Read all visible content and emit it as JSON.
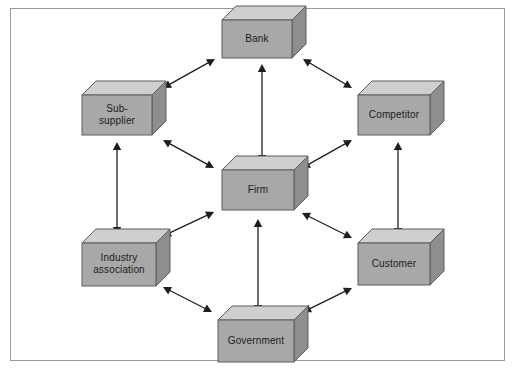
{
  "figure": {
    "kind": "network-diagram",
    "title": "",
    "frame": {
      "border_color": "#9a9a9a",
      "background": "#ffffff"
    },
    "box_colors": {
      "front": "#a8a8a8",
      "top": "#cfcfcf",
      "side": "#8e8e8e",
      "outline": "#5d5d5d"
    },
    "arrow_color": "#1e1e1e"
  },
  "nodes": [
    {
      "id": "bank",
      "label": "Bank",
      "lines": [
        "Bank"
      ],
      "x": 222,
      "y": 20,
      "w": 70,
      "h": 38,
      "depth": 14
    },
    {
      "id": "subsupplier",
      "label": "Sub-supplier",
      "lines": [
        "Sub-",
        "supplier"
      ],
      "x": 82,
      "y": 95,
      "w": 70,
      "h": 40,
      "depth": 14
    },
    {
      "id": "competitor",
      "label": "Competitor",
      "lines": [
        "Competitor"
      ],
      "x": 358,
      "y": 95,
      "w": 72,
      "h": 40,
      "depth": 14
    },
    {
      "id": "firm",
      "label": "Firm",
      "lines": [
        "Firm"
      ],
      "x": 222,
      "y": 170,
      "w": 72,
      "h": 40,
      "depth": 14
    },
    {
      "id": "industry",
      "label": "Industry association",
      "lines": [
        "Industry",
        "association"
      ],
      "x": 82,
      "y": 243,
      "w": 74,
      "h": 43,
      "depth": 14
    },
    {
      "id": "customer",
      "label": "Customer",
      "lines": [
        "Customer"
      ],
      "x": 358,
      "y": 243,
      "w": 72,
      "h": 42,
      "depth": 14
    },
    {
      "id": "government",
      "label": "Government",
      "lines": [
        "Government"
      ],
      "x": 218,
      "y": 320,
      "w": 76,
      "h": 42,
      "depth": 14
    }
  ],
  "connections": [
    {
      "from": "subsupplier",
      "to": "bank",
      "style": "double-arrow"
    },
    {
      "from": "bank",
      "to": "competitor",
      "style": "double-arrow"
    },
    {
      "from": "bank",
      "to": "firm",
      "style": "double-arrow"
    },
    {
      "from": "subsupplier",
      "to": "firm",
      "style": "double-arrow"
    },
    {
      "from": "competitor",
      "to": "firm",
      "style": "double-arrow"
    },
    {
      "from": "subsupplier",
      "to": "industry",
      "style": "double-arrow"
    },
    {
      "from": "competitor",
      "to": "customer",
      "style": "double-arrow"
    },
    {
      "from": "industry",
      "to": "firm",
      "style": "double-arrow"
    },
    {
      "from": "customer",
      "to": "firm",
      "style": "double-arrow"
    },
    {
      "from": "industry",
      "to": "government",
      "style": "double-arrow"
    },
    {
      "from": "customer",
      "to": "government",
      "style": "double-arrow"
    },
    {
      "from": "government",
      "to": "firm",
      "style": "double-arrow"
    }
  ],
  "arrow_segments": [
    {
      "name": "subsupplier-bank",
      "x1": 163,
      "y1": 88,
      "x2": 215,
      "y2": 59
    },
    {
      "name": "bank-competitor",
      "x1": 303,
      "y1": 59,
      "x2": 352,
      "y2": 88
    },
    {
      "name": "bank-firm",
      "x1": 262,
      "y1": 64,
      "x2": 262,
      "y2": 163
    },
    {
      "name": "subsupplier-firm",
      "x1": 163,
      "y1": 140,
      "x2": 214,
      "y2": 168
    },
    {
      "name": "competitor-firm",
      "x1": 352,
      "y1": 140,
      "x2": 302,
      "y2": 168
    },
    {
      "name": "subsupplier-industry",
      "x1": 117,
      "y1": 142,
      "x2": 117,
      "y2": 235
    },
    {
      "name": "competitor-customer",
      "x1": 398,
      "y1": 142,
      "x2": 398,
      "y2": 236
    },
    {
      "name": "industry-firm",
      "x1": 163,
      "y1": 236,
      "x2": 214,
      "y2": 212
    },
    {
      "name": "customer-firm",
      "x1": 352,
      "y1": 238,
      "x2": 302,
      "y2": 213
    },
    {
      "name": "industry-government",
      "x1": 163,
      "y1": 287,
      "x2": 212,
      "y2": 312
    },
    {
      "name": "customer-government",
      "x1": 352,
      "y1": 288,
      "x2": 303,
      "y2": 312
    },
    {
      "name": "government-firm",
      "x1": 258,
      "y1": 313,
      "x2": 258,
      "y2": 219
    }
  ]
}
